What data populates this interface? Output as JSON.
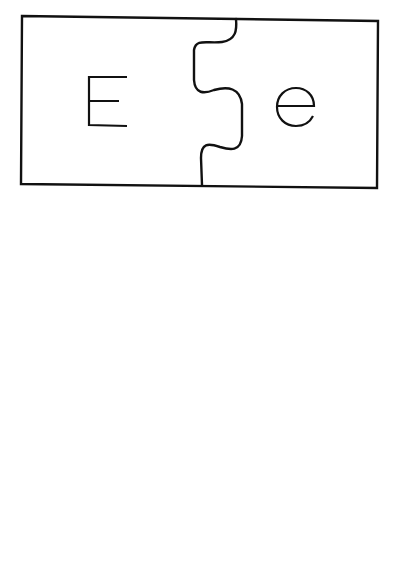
{
  "worksheet": {
    "type": "alphabet-matching-puzzles",
    "stroke_color": "#111111",
    "background_color": "#ffffff",
    "puzzles": [
      {
        "uppercase": "E",
        "lowercase": "e"
      },
      {
        "uppercase": "R",
        "lowercase": "r"
      },
      {
        "uppercase": "T",
        "lowercase": "t"
      }
    ]
  }
}
